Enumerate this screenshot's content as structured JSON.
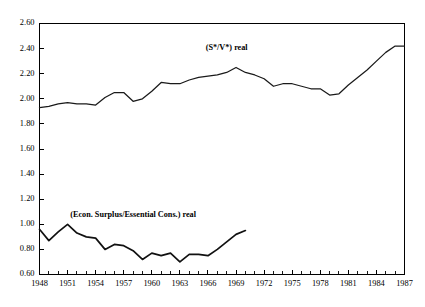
{
  "chart_data": {
    "type": "line",
    "title": "",
    "subtitle": "",
    "xlabel": "",
    "ylabel": "",
    "xlim": [
      1948,
      1987
    ],
    "ylim": [
      0.6,
      2.6
    ],
    "grid": false,
    "legend_position": "inline-annotation",
    "y_ticks": [
      "2.60",
      "2.40",
      "2.20",
      "2.00",
      "1.80",
      "1.60",
      "1.40",
      "1.20",
      "1.00",
      "0.80",
      "0.60"
    ],
    "y_tick_values": [
      2.6,
      2.4,
      2.2,
      2.0,
      1.8,
      1.6,
      1.4,
      1.2,
      1.0,
      0.8,
      0.6
    ],
    "x_ticks": [
      "1948",
      "1951",
      "1954",
      "1957",
      "1960",
      "1963",
      "1966",
      "1969",
      "1972",
      "1975",
      "1978",
      "1981",
      "1984",
      "1987"
    ],
    "x_tick_values": [
      1948,
      1951,
      1954,
      1957,
      1960,
      1963,
      1966,
      1969,
      1972,
      1975,
      1978,
      1981,
      1984,
      1987
    ],
    "x_minor_tick_step": 1,
    "series": [
      {
        "name": "(S*/V*) real",
        "annotation": "(S*/V*) real",
        "annotation_x": 1968,
        "annotation_y": 2.39,
        "x": [
          1948,
          1949,
          1950,
          1951,
          1952,
          1953,
          1954,
          1955,
          1956,
          1957,
          1958,
          1959,
          1960,
          1961,
          1962,
          1963,
          1964,
          1965,
          1966,
          1967,
          1968,
          1969,
          1970,
          1971,
          1972,
          1973,
          1974,
          1975,
          1976,
          1977,
          1978,
          1979,
          1980,
          1981,
          1982,
          1983,
          1984,
          1985,
          1986,
          1987
        ],
        "values": [
          1.93,
          1.94,
          1.96,
          1.97,
          1.96,
          1.96,
          1.95,
          2.01,
          2.05,
          2.05,
          1.98,
          2.0,
          2.06,
          2.13,
          2.12,
          2.12,
          2.15,
          2.17,
          2.18,
          2.19,
          2.21,
          2.25,
          2.21,
          2.19,
          2.16,
          2.1,
          2.12,
          2.12,
          2.1,
          2.08,
          2.08,
          2.03,
          2.04,
          2.11,
          2.17,
          2.23,
          2.3,
          2.37,
          2.42,
          2.42
        ]
      },
      {
        "name": "(Econ. Surplus/Essential Cons.) real",
        "annotation": "(Econ. Surplus/Essential Cons.) real",
        "annotation_x": 1958,
        "annotation_y": 1.06,
        "x": [
          1948,
          1949,
          1950,
          1951,
          1952,
          1953,
          1954,
          1955,
          1956,
          1957,
          1958,
          1959,
          1960,
          1961,
          1962,
          1963,
          1964,
          1965,
          1966,
          1967,
          1968,
          1969,
          1970
        ],
        "values": [
          0.96,
          0.87,
          0.94,
          1.0,
          0.93,
          0.9,
          0.89,
          0.8,
          0.84,
          0.83,
          0.79,
          0.72,
          0.77,
          0.75,
          0.77,
          0.7,
          0.76,
          0.76,
          0.75,
          0.8,
          0.86,
          0.92,
          0.95
        ]
      }
    ]
  }
}
